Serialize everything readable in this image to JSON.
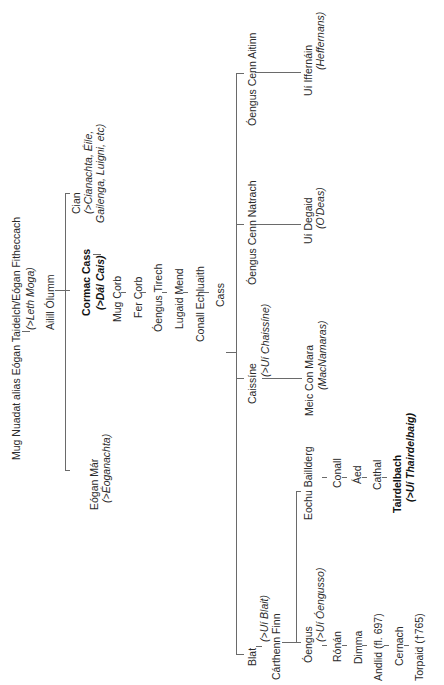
{
  "diagram": {
    "type": "genealogical-tree",
    "orientation": "rotated-90-ccw",
    "root": {
      "name": "Mug Nuadat alias Eógan Taidelch/Eógan Fitheccach",
      "note": "(>Leth Moga)"
    },
    "ailill": {
      "name": "Ailill Ólumm"
    },
    "ailill_children": {
      "cian": {
        "name": "Cian",
        "note_line1": "(>Cianachta, Éile,",
        "note_line2": "Gailenga, Luigni, etc)"
      },
      "cormac": {
        "name": "Cormac Cass",
        "note": "(>Dál Cais)"
      },
      "eogan": {
        "name": "Eógan Már",
        "note": "(>Éoganachta)"
      }
    },
    "cormac_line": [
      "Mug Corb",
      "Fer Corb",
      "Óengus Tirech",
      "Lugaid Mend",
      "Conall Echluaith",
      "Cass"
    ],
    "cass_children": {
      "oengus_cenn_aitinn": {
        "name": "Óengus Cenn Aitinn",
        "descendant": "Uí Iffernáin",
        "descendant_note": "(Heffernans)"
      },
      "oengus_cenn_natrach": {
        "name": "Óengus Cenn Natrach",
        "descendant": "Uí Degaid",
        "descendant_note": "(O'Deas)"
      },
      "caissene": {
        "name": "Caissíne",
        "note": "(>Uí Chaissíne)",
        "descendant": "Meic Con Mara",
        "descendant_note": "(MacNamaras)"
      },
      "blat": {
        "name": "Blat",
        "note": "(>Uí Blait)"
      },
      "cairthenn": {
        "name": "Cárthenn Finn"
      }
    },
    "cairthenn_children": {
      "eochu": {
        "name": "Eochu Baillderg",
        "line": [
          "Conall",
          "Áed",
          "Cathal"
        ],
        "end": "Tairdelbach",
        "end_note": "(>Uí Thairdelbaig)"
      },
      "oengus": {
        "name": "Óengus",
        "note": "(>Uí Óengusso)",
        "line": [
          "Rónán",
          "Dimma",
          "Andlid (fl. 697)",
          "Cernach",
          "Torpaid (†765)"
        ]
      }
    }
  }
}
